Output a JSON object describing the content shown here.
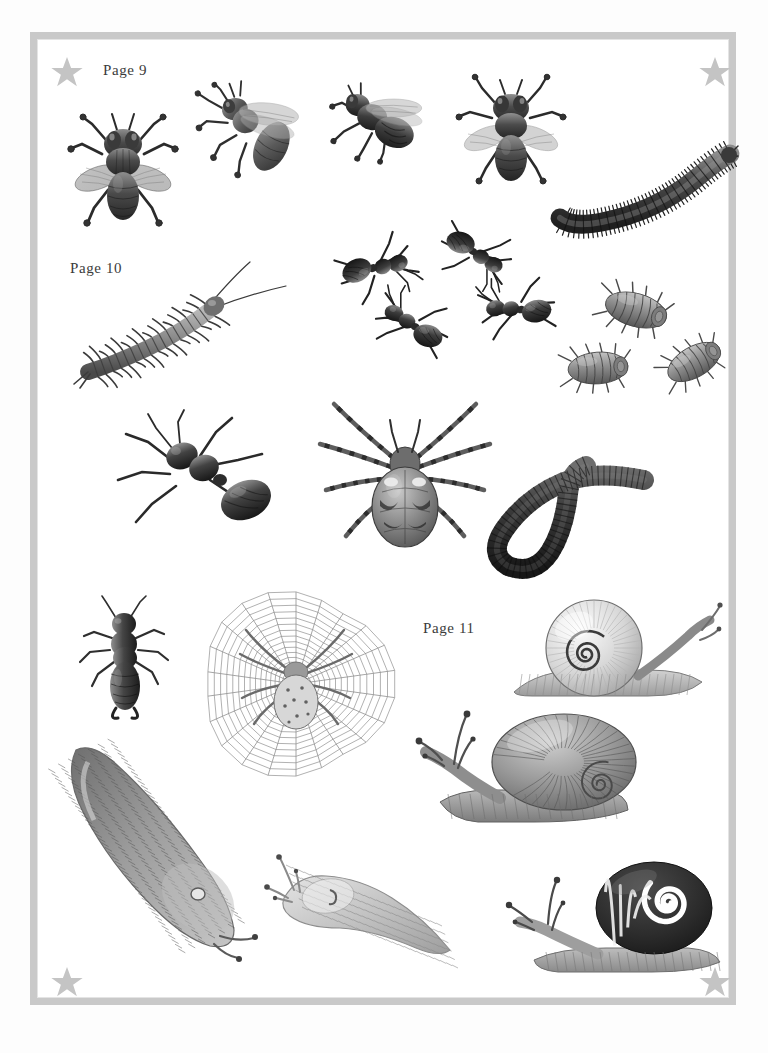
{
  "sheet": {
    "kind": "sticker-sheet",
    "background_color": "#fdfdfd",
    "frame_color": "#c9c9c9",
    "page_color": "#ffffff",
    "ink_color": "#3b3b3b"
  },
  "corner_stars": [
    {
      "name": "star-top-left",
      "x": 50,
      "y": 55
    },
    {
      "name": "star-top-right",
      "x": 698,
      "y": 55
    },
    {
      "name": "star-bottom-left",
      "x": 50,
      "y": 965
    },
    {
      "name": "star-bottom-right",
      "x": 698,
      "y": 965
    }
  ],
  "labels": [
    {
      "text": "Page 9",
      "x": 103,
      "y": 62
    },
    {
      "text": "Page 10",
      "x": 70,
      "y": 260
    },
    {
      "text": "Page 11",
      "x": 423,
      "y": 620
    }
  ],
  "specimens": [
    {
      "name": "housefly-dorsal",
      "label": "housefly (top view)",
      "x": 62,
      "y": 104,
      "w": 122,
      "h": 128,
      "rotate": 0
    },
    {
      "name": "hoverfly-angled",
      "label": "fly (angled view)",
      "x": 196,
      "y": 76,
      "w": 112,
      "h": 112,
      "rotate": -12
    },
    {
      "name": "fly-side",
      "label": "fly (side view)",
      "x": 326,
      "y": 76,
      "w": 104,
      "h": 86,
      "rotate": 8
    },
    {
      "name": "bluebottle-dorsal",
      "label": "bluebottle fly (top view)",
      "x": 452,
      "y": 74,
      "w": 118,
      "h": 112,
      "rotate": 0
    },
    {
      "name": "millipede",
      "label": "millipede",
      "x": 546,
      "y": 136,
      "w": 192,
      "h": 100,
      "rotate": 0
    },
    {
      "name": "ant-group",
      "label": "four ants",
      "x": 318,
      "y": 216,
      "w": 238,
      "h": 140,
      "rotate": 0
    },
    {
      "name": "centipede",
      "label": "centipede",
      "x": 64,
      "y": 260,
      "w": 226,
      "h": 128,
      "rotate": 0
    },
    {
      "name": "woodlouse-group",
      "label": "three woodlice",
      "x": 548,
      "y": 276,
      "w": 192,
      "h": 122,
      "rotate": 0
    },
    {
      "name": "black-ant-large",
      "label": "large black ant",
      "x": 104,
      "y": 404,
      "w": 180,
      "h": 156,
      "rotate": 0
    },
    {
      "name": "garden-spider",
      "label": "garden spider",
      "x": 312,
      "y": 382,
      "w": 186,
      "h": 184,
      "rotate": 0
    },
    {
      "name": "earthworm",
      "label": "earthworm",
      "x": 468,
      "y": 446,
      "w": 178,
      "h": 128,
      "rotate": 0
    },
    {
      "name": "earwig",
      "label": "earwig",
      "x": 68,
      "y": 596,
      "w": 114,
      "h": 124,
      "rotate": 0
    },
    {
      "name": "spider-web",
      "label": "orb web with spider",
      "x": 198,
      "y": 572,
      "w": 196,
      "h": 208,
      "rotate": 0
    },
    {
      "name": "snail-pale-banded",
      "label": "pale banded snail",
      "x": 498,
      "y": 596,
      "w": 226,
      "h": 118,
      "rotate": 0
    },
    {
      "name": "snail-garden",
      "label": "garden snail",
      "x": 414,
      "y": 706,
      "w": 236,
      "h": 122,
      "rotate": 0
    },
    {
      "name": "slug-large-dark",
      "label": "large dark slug",
      "x": 58,
      "y": 736,
      "w": 216,
      "h": 226,
      "rotate": 0
    },
    {
      "name": "slug-pale",
      "label": "pale slug",
      "x": 264,
      "y": 846,
      "w": 196,
      "h": 118,
      "rotate": 0
    },
    {
      "name": "snail-striped-dark",
      "label": "dark striped snail",
      "x": 502,
      "y": 856,
      "w": 226,
      "h": 128,
      "rotate": 0
    }
  ]
}
